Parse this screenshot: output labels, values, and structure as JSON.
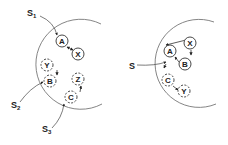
{
  "left_panel": {
    "sources": [
      {
        "id": "s1",
        "base": "S",
        "sub": "1",
        "target": "A"
      },
      {
        "id": "s2",
        "base": "S",
        "sub": "2",
        "target": "B"
      },
      {
        "id": "s3",
        "base": "S",
        "sub": "3",
        "target": "C"
      }
    ],
    "nodes": [
      {
        "id": "A",
        "label": "A",
        "style": "solid"
      },
      {
        "id": "X",
        "label": "X",
        "style": "solid"
      },
      {
        "id": "Y",
        "label": "Y",
        "style": "dashed"
      },
      {
        "id": "B",
        "label": "B",
        "style": "dashed"
      },
      {
        "id": "Z",
        "label": "Z",
        "style": "dashed"
      },
      {
        "id": "C",
        "label": "C",
        "style": "dashed"
      }
    ],
    "edges": [
      {
        "from": "A",
        "to": "X",
        "bidirectional": true
      },
      {
        "from": "Y",
        "to": "B"
      },
      {
        "from": "C",
        "to": "Z"
      }
    ]
  },
  "right_panel": {
    "sources": [
      {
        "id": "s",
        "base": "S",
        "sub": "",
        "target": "A,C"
      }
    ],
    "nodes": [
      {
        "id": "A",
        "label": "A",
        "style": "solid"
      },
      {
        "id": "X",
        "label": "X",
        "style": "solid"
      },
      {
        "id": "B",
        "label": "B",
        "style": "solid"
      },
      {
        "id": "C",
        "label": "C",
        "style": "dashed"
      },
      {
        "id": "Y",
        "label": "Y",
        "style": "dashed"
      }
    ],
    "edges": [
      {
        "from": "A",
        "to": "X"
      },
      {
        "from": "X",
        "to": "B"
      },
      {
        "from": "B",
        "to": "A"
      },
      {
        "from": "C",
        "to": "Y"
      }
    ]
  },
  "colors": {
    "stroke": "#333333",
    "boundary": "#777777",
    "background": "#ffffff"
  }
}
